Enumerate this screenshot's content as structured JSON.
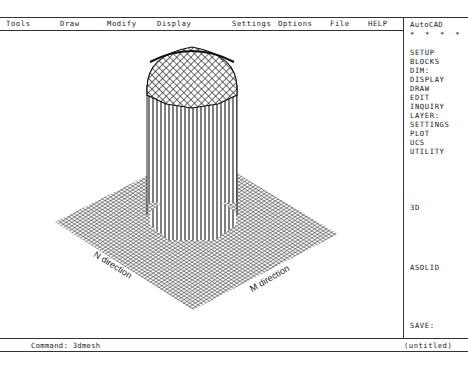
{
  "app": {
    "name": "AutoCAD"
  },
  "menubar": {
    "items": [
      {
        "label": "Tools",
        "x": 6
      },
      {
        "label": "Draw",
        "x": 60
      },
      {
        "label": "Modify",
        "x": 107
      },
      {
        "label": "Display",
        "x": 157
      },
      {
        "label": "Settings",
        "x": 232
      },
      {
        "label": "Options",
        "x": 278
      },
      {
        "label": "File",
        "x": 330
      },
      {
        "label": "HELP",
        "x": 368
      }
    ]
  },
  "side_menu": {
    "title": "AutoCAD",
    "stars": "* * * *",
    "items": [
      {
        "label": "SETUP",
        "y": 30
      },
      {
        "label": "BLOCKS",
        "y": 39
      },
      {
        "label": "DIM:",
        "y": 48
      },
      {
        "label": "DISPLAY",
        "y": 57
      },
      {
        "label": "DRAW",
        "y": 66
      },
      {
        "label": "EDIT",
        "y": 75
      },
      {
        "label": "INQUIRY",
        "y": 84
      },
      {
        "label": "LAYER:",
        "y": 93
      },
      {
        "label": "SETTINGS",
        "y": 102
      },
      {
        "label": "PLOT",
        "y": 111
      },
      {
        "label": "UCS",
        "y": 120
      },
      {
        "label": "UTILITY",
        "y": 129
      },
      {
        "label": "3D",
        "y": 185
      },
      {
        "label": "ASOLID",
        "y": 245
      },
      {
        "label": "SAVE:",
        "y": 303
      }
    ]
  },
  "command_line": {
    "prompt": "Command: 3dmesh",
    "drawing_name": "(untitled)"
  },
  "drawing": {
    "description": "3D mesh plane with raised cylindrical column and domed cap",
    "labels": {
      "n_direction": "N direction",
      "m_direction": "M direction"
    }
  }
}
